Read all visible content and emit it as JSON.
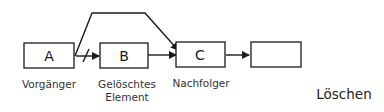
{
  "diagram": {
    "title": "Löschen",
    "nodes": [
      {
        "id": "A",
        "label": "A",
        "caption": "Vorgänger"
      },
      {
        "id": "B",
        "label": "B",
        "caption_line1": "Gelöschtes",
        "caption_line2": "Element"
      },
      {
        "id": "C",
        "label": "C",
        "caption": "Nachfolger"
      },
      {
        "id": "D",
        "label": ""
      }
    ],
    "edges": [
      {
        "from": "A",
        "to": "B",
        "style": "struck-through"
      },
      {
        "from": "B",
        "to": "C",
        "style": "arrow"
      },
      {
        "from": "C",
        "to": "D",
        "style": "arrow"
      },
      {
        "from": "A",
        "to": "C",
        "style": "bypass-arrow"
      }
    ],
    "colors": {
      "stroke": "#1a1a1a",
      "text": "#333333",
      "background": "#ffffff"
    }
  }
}
